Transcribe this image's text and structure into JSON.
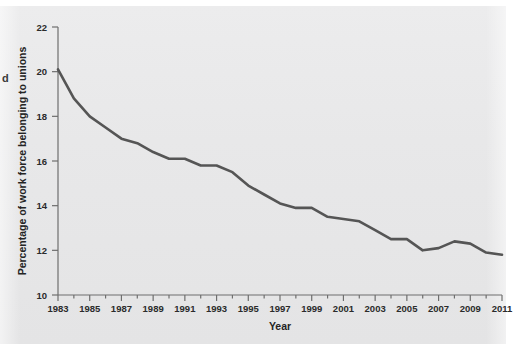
{
  "figure": {
    "background_color": "#e8e8e9",
    "page_color": "#ffffff",
    "edge_text_fragment": "d"
  },
  "chart_data": {
    "type": "line",
    "title": "",
    "xlabel": "Year",
    "ylabel": "Percentage of work force belonging to unions",
    "xlim": [
      1983,
      2011
    ],
    "ylim": [
      10,
      22
    ],
    "grid": false,
    "legend": "none",
    "line_color": "#555555",
    "line_width": 2.6,
    "x_major_ticks": [
      1983,
      1985,
      1987,
      1989,
      1991,
      1993,
      1995,
      1997,
      1999,
      2001,
      2003,
      2005,
      2007,
      2009,
      2011
    ],
    "x_minor_tick_step": 1,
    "y_ticks": [
      10,
      12,
      14,
      16,
      18,
      20,
      22
    ],
    "x": [
      1983,
      1984,
      1985,
      1986,
      1987,
      1988,
      1989,
      1990,
      1991,
      1992,
      1993,
      1994,
      1995,
      1996,
      1997,
      1998,
      1999,
      2000,
      2001,
      2002,
      2003,
      2004,
      2005,
      2006,
      2007,
      2008,
      2009,
      2010,
      2011
    ],
    "values": [
      20.1,
      18.8,
      18.0,
      17.5,
      17.0,
      16.8,
      16.4,
      16.1,
      16.1,
      15.8,
      15.8,
      15.5,
      14.9,
      14.5,
      14.1,
      13.9,
      13.9,
      13.5,
      13.4,
      13.3,
      12.9,
      12.5,
      12.5,
      12.0,
      12.1,
      12.4,
      12.3,
      11.9,
      11.8
    ],
    "series_name": "Percentage of work force belonging to unions",
    "annotations": []
  },
  "axis": {
    "y_tick_labels": [
      "10",
      "12",
      "14",
      "16",
      "18",
      "20",
      "22"
    ],
    "x_tick_labels": [
      "1983",
      "1985",
      "1987",
      "1989",
      "1991",
      "1993",
      "1995",
      "1997",
      "1999",
      "2001",
      "2003",
      "2005",
      "2007",
      "2009",
      "2011"
    ],
    "x_title": "Year",
    "y_title": "Percentage of work force belonging to unions"
  }
}
